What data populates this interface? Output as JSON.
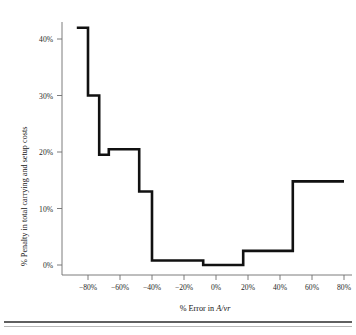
{
  "chart_data": {
    "type": "line",
    "title": "",
    "xlabel": "% Error in A/vr",
    "xlabel_plain": "% Error in ",
    "xlabel_italic": "A/vr",
    "ylabel": "% Penalty in total carrying and setup costs",
    "xlim": [
      -95,
      82
    ],
    "ylim": [
      -1.5,
      44
    ],
    "grid": false,
    "legend": null,
    "xticks": [
      -80,
      -60,
      -40,
      -20,
      0,
      20,
      40,
      60,
      80
    ],
    "xtick_labels": [
      "−80%",
      "−60%",
      "−40%",
      "−20%",
      "0%",
      "20%",
      "40%",
      "60%",
      "80%"
    ],
    "yticks": [
      0,
      10,
      20,
      30,
      40
    ],
    "ytick_labels": [
      "0%",
      "10%",
      "20%",
      "30%",
      "40%"
    ],
    "series_name": "Penalty vs error",
    "line_color": "#111111",
    "step_style": "post",
    "x": [
      -87,
      -80,
      -80,
      -73,
      -73,
      -67,
      -67,
      -62,
      -62,
      -48,
      -48,
      -40,
      -40,
      -22,
      -22,
      -8,
      -8,
      17,
      17,
      48,
      48,
      80
    ],
    "y": [
      42.0,
      42.0,
      30.0,
      30.0,
      19.5,
      19.5,
      20.5,
      20.5,
      13.0,
      13.0,
      0.8,
      0.8,
      0.8,
      0.8,
      0.0,
      0.0,
      0.0,
      0.0,
      2.5,
      2.5,
      14.8,
      14.8
    ],
    "steps": [
      {
        "x_start": -87,
        "x_end": -80,
        "value": 42.0
      },
      {
        "x_start": -80,
        "x_end": -73,
        "value": 30.0
      },
      {
        "x_start": -73,
        "x_end": -67,
        "value": 19.5
      },
      {
        "x_start": -67,
        "x_end": -48,
        "value": 20.5
      },
      {
        "x_start": -48,
        "x_end": -40,
        "value": 13.0
      },
      {
        "x_start": -40,
        "x_end": -8,
        "value": 0.8
      },
      {
        "x_start": -8,
        "x_end": 17,
        "value": 0.0
      },
      {
        "x_start": 17,
        "x_end": 48,
        "value": 2.5
      },
      {
        "x_start": 48,
        "x_end": 80,
        "value": 14.8
      }
    ]
  }
}
